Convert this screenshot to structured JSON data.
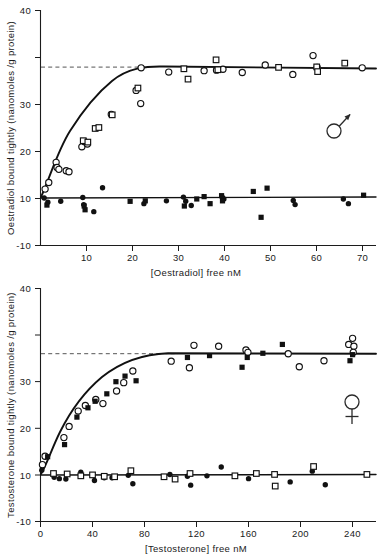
{
  "figure": {
    "name": "steroid-binding-saturation-figure",
    "panels": [
      "top",
      "bottom"
    ]
  },
  "chart_data": [
    {
      "type": "scatter",
      "panel": "top",
      "title": "",
      "xlabel": "[Oestradiol]  free nM",
      "ylabel": "Oestradiol bound tightly (nanomoles /g protein)",
      "xlim": [
        0,
        73
      ],
      "ylim": [
        -10,
        40
      ],
      "xticks": [
        0,
        10,
        20,
        30,
        40,
        50,
        60,
        70
      ],
      "xticklabels": [
        "",
        "10",
        "20",
        "30",
        "40",
        "50",
        "60",
        "70"
      ],
      "yticks": [
        -10,
        0,
        10,
        20,
        30,
        40
      ],
      "yticklabels": [
        "-10",
        "0",
        "10",
        "20",
        "30",
        "40"
      ],
      "grid": false,
      "legend": "none",
      "sex_symbol": "male",
      "annotations": [
        {
          "name": "plateau-dashed-line",
          "type": "hline",
          "y": 28,
          "style": "dashed",
          "x_from": 0,
          "x_to": 22
        }
      ],
      "series": [
        {
          "name": "Specifically bound (open circles)",
          "marker": "open-circle",
          "points": [
            [
              1.0,
              2.0
            ],
            [
              1.8,
              3.4
            ],
            [
              3.4,
              7.7
            ],
            [
              3.6,
              6.6
            ],
            [
              4.0,
              6.2
            ],
            [
              5.6,
              5.9
            ],
            [
              6.2,
              5.7
            ],
            [
              9.0,
              11.0
            ],
            [
              9.6,
              12.1
            ],
            [
              10.2,
              11.6
            ],
            [
              15.4,
              17.9
            ],
            [
              20.8,
              23.0
            ],
            [
              21.8,
              20.2
            ],
            [
              21.9,
              27.8
            ],
            [
              27.9,
              26.9
            ],
            [
              35.6,
              27.2
            ],
            [
              38.3,
              27.3
            ],
            [
              39.7,
              27.5
            ],
            [
              43.9,
              26.8
            ],
            [
              48.9,
              28.4
            ],
            [
              54.9,
              26.4
            ],
            [
              59.3,
              30.4
            ],
            [
              60.2,
              27.9
            ],
            [
              70.0,
              27.8
            ]
          ]
        },
        {
          "name": "Specifically bound (open squares)",
          "marker": "open-square",
          "points": [
            [
              9.3,
              12.3
            ],
            [
              10.3,
              12.0
            ],
            [
              11.9,
              14.9
            ],
            [
              12.7,
              15.1
            ],
            [
              15.6,
              17.8
            ],
            [
              21.2,
              23.5
            ],
            [
              31.2,
              27.6
            ],
            [
              32.1,
              25.4
            ],
            [
              38.2,
              29.5
            ],
            [
              38.6,
              27.4
            ],
            [
              51.8,
              27.9
            ],
            [
              60.1,
              28.0
            ],
            [
              60.3,
              27.0
            ],
            [
              66.2,
              28.8
            ]
          ]
        },
        {
          "name": "Non-specific / blank (filled circles)",
          "marker": "filled-circle",
          "points": [
            [
              0.8,
              0.1
            ],
            [
              1.6,
              -0.8
            ],
            [
              4.4,
              -0.6
            ],
            [
              9.2,
              0.2
            ],
            [
              9.4,
              -1.3
            ],
            [
              11.6,
              -2.8
            ],
            [
              13.5,
              2.3
            ],
            [
              22.5,
              -1.1
            ],
            [
              27.4,
              -0.5
            ],
            [
              31.1,
              0.3
            ],
            [
              31.6,
              -0.6
            ],
            [
              32.8,
              -1.5
            ],
            [
              39.6,
              0.2
            ],
            [
              39.9,
              -0.1
            ],
            [
              55.0,
              -0.4
            ],
            [
              55.4,
              -1.3
            ],
            [
              65.9,
              -0.1
            ],
            [
              67.0,
              -1.1
            ]
          ]
        },
        {
          "name": "Non-specific / blank (filled squares)",
          "marker": "filled-square",
          "points": [
            [
              1.4,
              -1.4
            ],
            [
              9.5,
              -1.6
            ],
            [
              9.7,
              -2.4
            ],
            [
              19.5,
              -0.6
            ],
            [
              22.8,
              -0.5
            ],
            [
              31.3,
              -1.6
            ],
            [
              34.0,
              -0.1
            ],
            [
              35.6,
              0.4
            ],
            [
              36.9,
              -1.1
            ],
            [
              39.4,
              0.6
            ],
            [
              39.6,
              -0.5
            ],
            [
              46.3,
              1.5
            ],
            [
              48.0,
              -4.0
            ],
            [
              49.3,
              2.2
            ],
            [
              70.3,
              0.7
            ]
          ]
        }
      ]
    },
    {
      "type": "scatter",
      "panel": "bottom",
      "title": "",
      "xlabel": "[Testosterone]  free nM",
      "ylabel": "Testosterone bound tightly (nanomoles /g protein)",
      "xlim": [
        0,
        258
      ],
      "ylim": [
        -10,
        40
      ],
      "xticks": [
        0,
        40,
        80,
        120,
        160,
        200,
        240
      ],
      "xticklabels": [
        "0",
        "40",
        "80",
        "120",
        "160",
        "200",
        "240"
      ],
      "yticks": [
        -10,
        0,
        10,
        20,
        30,
        40
      ],
      "yticklabels": [
        "-10",
        "0",
        "10",
        "20",
        "30",
        "40"
      ],
      "grid": false,
      "legend": "none",
      "sex_symbol": "female",
      "annotations": [
        {
          "name": "plateau-dashed-line",
          "type": "hline",
          "y": 26,
          "style": "dashed",
          "x_from": 0,
          "x_to": 120
        }
      ],
      "series": [
        {
          "name": "Specifically bound (open circles)",
          "marker": "open-circle",
          "points": [
            [
              1.5,
              2.2
            ],
            [
              3.5,
              4.0
            ],
            [
              18.0,
              8.0
            ],
            [
              22.0,
              10.4
            ],
            [
              29.0,
              13.7
            ],
            [
              34.5,
              14.9
            ],
            [
              42.5,
              16.2
            ],
            [
              48.0,
              15.3
            ],
            [
              58.5,
              18.0
            ],
            [
              64.0,
              19.8
            ],
            [
              71.0,
              22.3
            ],
            [
              100.5,
              24.4
            ],
            [
              114.5,
              23.0
            ],
            [
              118.0,
              27.8
            ],
            [
              137.0,
              27.6
            ],
            [
              158.0,
              26.8
            ],
            [
              159.5,
              26.3
            ],
            [
              190.5,
              26.0
            ],
            [
              199.0,
              23.2
            ],
            [
              218.0,
              24.5
            ],
            [
              237.0,
              28.0
            ],
            [
              240.0,
              29.3
            ],
            [
              241.0,
              27.6
            ],
            [
              240.5,
              26.3
            ]
          ]
        },
        {
          "name": "Specifically bound (filled squares)",
          "marker": "filled-square",
          "points": [
            [
              5.5,
              3.9
            ],
            [
              18.5,
              6.5
            ],
            [
              28.0,
              12.4
            ],
            [
              36.5,
              14.4
            ],
            [
              42.0,
              15.8
            ],
            [
              51.0,
              17.4
            ],
            [
              58.0,
              20.0
            ],
            [
              65.0,
              21.2
            ],
            [
              73.5,
              20.2
            ],
            [
              113.0,
              25.2
            ],
            [
              130.0,
              25.6
            ],
            [
              155.0,
              23.1
            ],
            [
              159.0,
              25.2
            ],
            [
              171.0,
              26.1
            ],
            [
              186.0,
              28.0
            ],
            [
              238.0,
              24.5
            ],
            [
              240.0,
              25.8
            ]
          ]
        },
        {
          "name": "Non-specific / blank (filled circles)",
          "marker": "filled-circle",
          "points": [
            [
              1.0,
              1.0
            ],
            [
              10.5,
              -0.5
            ],
            [
              14.5,
              -0.8
            ],
            [
              19.5,
              -0.9
            ],
            [
              31.0,
              0.6
            ],
            [
              41.5,
              -1.2
            ],
            [
              49.0,
              -0.6
            ],
            [
              55.0,
              -0.6
            ],
            [
              67.5,
              -0.1
            ],
            [
              71.0,
              -1.9
            ],
            [
              99.5,
              0.1
            ],
            [
              113.0,
              -0.3
            ],
            [
              115.5,
              -2.2
            ],
            [
              128.0,
              -0.2
            ],
            [
              139.0,
              1.7
            ],
            [
              160.0,
              -0.8
            ],
            [
              192.0,
              -1.5
            ],
            [
              209.0,
              0.8
            ],
            [
              219.0,
              -2.1
            ]
          ]
        },
        {
          "name": "Non-specific / blank (open squares)",
          "marker": "open-square",
          "points": [
            [
              10.0,
              0.3
            ],
            [
              20.5,
              0.2
            ],
            [
              31.0,
              -0.2
            ],
            [
              40.0,
              0.0
            ],
            [
              49.0,
              -0.3
            ],
            [
              57.0,
              -0.4
            ],
            [
              69.5,
              0.9
            ],
            [
              95.0,
              -0.4
            ],
            [
              103.5,
              -0.9
            ],
            [
              115.0,
              0.3
            ],
            [
              149.5,
              -0.2
            ],
            [
              166.0,
              0.3
            ],
            [
              180.5,
              -2.4
            ],
            [
              180.0,
              0.1
            ],
            [
              210.0,
              1.8
            ],
            [
              251.0,
              0.1
            ]
          ]
        }
      ]
    }
  ],
  "symbols": {
    "male": "male-sex-symbol",
    "female": "female-sex-symbol"
  }
}
